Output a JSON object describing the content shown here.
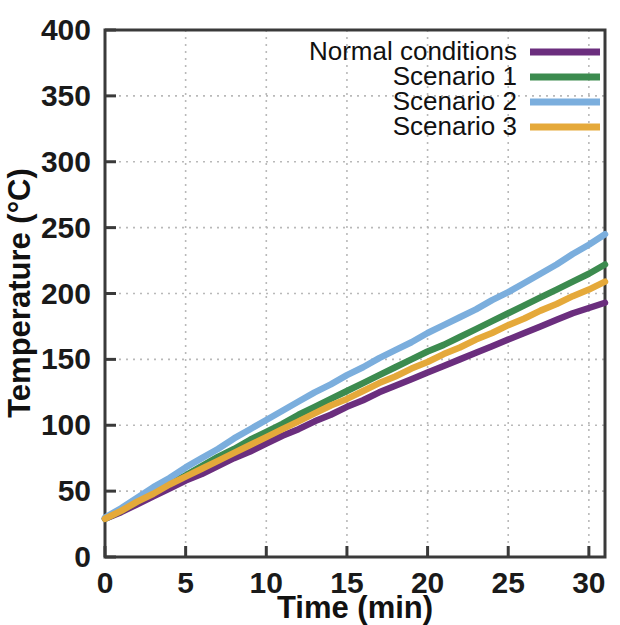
{
  "chart_data": {
    "type": "line",
    "title": "",
    "xlabel": "Time (min)",
    "ylabel": "Temperature (°C)",
    "xlim": [
      0,
      31
    ],
    "ylim": [
      0,
      400
    ],
    "xticks": [
      0,
      5,
      10,
      15,
      20,
      25,
      30
    ],
    "yticks": [
      0,
      50,
      100,
      150,
      200,
      250,
      300,
      350,
      400
    ],
    "xticklabels": [
      "0",
      "5",
      "10",
      "15",
      "20",
      "25",
      "30"
    ],
    "yticklabels": [
      "0",
      "50",
      "100",
      "150",
      "200",
      "250",
      "300",
      "350",
      "400"
    ],
    "grid": true,
    "grid_style": "dotted",
    "legend_position": "top-right",
    "x": [
      0,
      1,
      2,
      3,
      4,
      5,
      6,
      7,
      8,
      9,
      10,
      11,
      12,
      13,
      14,
      15,
      16,
      17,
      18,
      19,
      20,
      21,
      22,
      23,
      24,
      25,
      26,
      27,
      28,
      29,
      30,
      31
    ],
    "series": [
      {
        "name": "Normal conditions",
        "color": "#6B2E7E",
        "values": [
          29,
          34,
          40,
          46,
          52,
          58,
          63,
          69,
          75,
          80,
          86,
          92,
          97,
          103,
          108,
          114,
          119,
          125,
          130,
          135,
          140,
          145,
          150,
          155,
          160,
          165,
          170,
          175,
          180,
          185,
          189,
          193
        ]
      },
      {
        "name": "Scenario 1",
        "color": "#3C8B4F",
        "values": [
          29,
          35,
          42,
          49,
          56,
          62,
          69,
          76,
          82,
          89,
          95,
          101,
          108,
          114,
          120,
          126,
          132,
          138,
          144,
          150,
          156,
          161,
          167,
          173,
          179,
          185,
          191,
          197,
          203,
          209,
          215,
          222
        ]
      },
      {
        "name": "Scenario 2",
        "color": "#7BAEDD",
        "values": [
          30,
          37,
          45,
          53,
          60,
          68,
          75,
          82,
          90,
          97,
          104,
          111,
          118,
          125,
          131,
          138,
          144,
          151,
          157,
          163,
          170,
          176,
          182,
          188,
          195,
          201,
          208,
          215,
          222,
          230,
          237,
          245
        ]
      },
      {
        "name": "Scenario 3",
        "color": "#E5A93A",
        "values": [
          29,
          35,
          42,
          48,
          55,
          61,
          67,
          73,
          79,
          85,
          91,
          97,
          103,
          109,
          115,
          120,
          126,
          132,
          137,
          143,
          148,
          154,
          159,
          165,
          170,
          176,
          181,
          187,
          192,
          198,
          203,
          209
        ]
      }
    ]
  },
  "legend": {
    "items": [
      {
        "label": "Normal conditions",
        "color": "#6B2E7E"
      },
      {
        "label": "Scenario 1",
        "color": "#3C8B4F"
      },
      {
        "label": "Scenario 2",
        "color": "#7BAEDD"
      },
      {
        "label": "Scenario 3",
        "color": "#E5A93A"
      }
    ]
  },
  "axes": {
    "x_title": "Time (min)",
    "y_title": "Temperature (°C)"
  }
}
